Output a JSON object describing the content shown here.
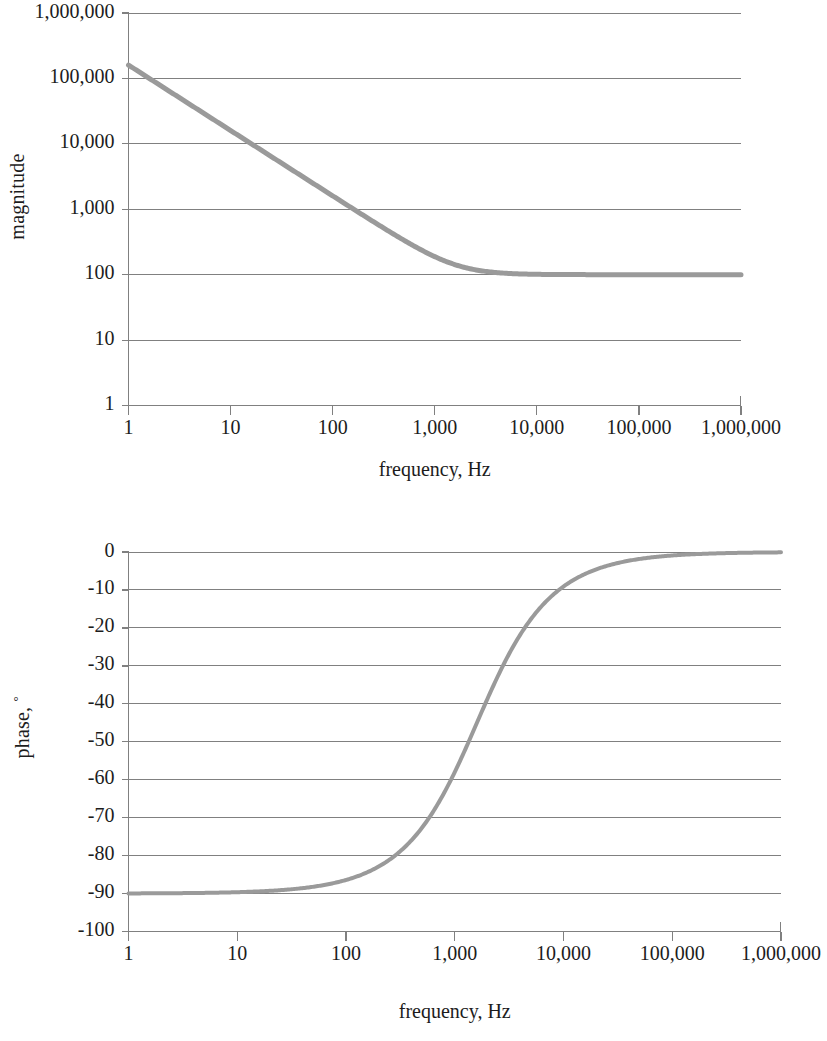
{
  "figure": {
    "panels": [
      "magnitude-plot",
      "phase-plot"
    ]
  },
  "magnitude": {
    "ylabel": "magnitude",
    "xlabel": "frequency, Hz",
    "y_ticks": [
      "1",
      "10",
      "100",
      "1,000",
      "10,000",
      "100,000",
      "1,000,000"
    ],
    "x_ticks": [
      "1",
      "10",
      "100",
      "1,000",
      "10,000",
      "100,000",
      "1,000,000"
    ]
  },
  "phase": {
    "ylabel_text": "phase, ",
    "ylabel_degree": "°",
    "xlabel": "frequency, Hz",
    "y_ticks": [
      "0",
      "-10",
      "-20",
      "-30",
      "-40",
      "-50",
      "-60",
      "-70",
      "-80",
      "-90",
      "-100"
    ],
    "x_ticks": [
      "1",
      "10",
      "100",
      "1,000",
      "10,000",
      "100,000",
      "1,000,000"
    ]
  },
  "colors": {
    "curve": "#9a9a9a",
    "grid": "#808080",
    "text": "#1c1c1c",
    "background": "#ffffff"
  },
  "chart_data": [
    {
      "type": "line",
      "id": "magnitude-plot",
      "title": "",
      "xlabel": "frequency, Hz",
      "ylabel": "magnitude",
      "xscale": "log",
      "yscale": "log",
      "xlim": [
        1,
        1000000
      ],
      "ylim": [
        1,
        1000000
      ],
      "xticks": [
        1,
        10,
        100,
        1000,
        10000,
        100000,
        1000000
      ],
      "xticklabels": [
        "1",
        "10",
        "100",
        "1,000",
        "10,000",
        "100,000",
        "1,000,000"
      ],
      "yticks": [
        1,
        10,
        100,
        1000,
        10000,
        100000,
        1000000
      ],
      "yticklabels": [
        "1",
        "10",
        "100",
        "1,000",
        "10,000",
        "100,000",
        "1,000,000"
      ],
      "grid": "horizontal",
      "legend": null,
      "description": "First-order low-pass magnitude asymptote: DC gain approx 1.6e5 at 1 Hz, -20 dB/decade roll-off, flattening to plateau of 100 above approx 5,000 Hz",
      "model": "|H(f)| = 100 * sqrt(1 + (f0/f)^2) with f0 = 1600 Hz",
      "series": [
        {
          "name": "magnitude",
          "x": [
            1,
            2,
            5,
            10,
            20,
            50,
            100,
            200,
            500,
            1000,
            1600,
            2000,
            3000,
            5000,
            10000,
            20000,
            50000,
            100000,
            300000,
            1000000
          ],
          "y": [
            160000,
            80000,
            32000,
            16000,
            8000,
            3200,
            1600,
            800,
            322,
            189,
            141,
            128,
            113,
            105,
            101,
            100.3,
            100.1,
            100,
            100,
            100
          ]
        }
      ]
    },
    {
      "type": "line",
      "id": "phase-plot",
      "title": "",
      "xlabel": "frequency, Hz",
      "ylabel": "phase, °",
      "xscale": "log",
      "yscale": "linear",
      "xlim": [
        1,
        1000000
      ],
      "ylim": [
        -100,
        0
      ],
      "xticks": [
        1,
        10,
        100,
        1000,
        10000,
        100000,
        1000000
      ],
      "xticklabels": [
        "1",
        "10",
        "100",
        "1,000",
        "10,000",
        "100,000",
        "1,000,000"
      ],
      "yticks": [
        0,
        -10,
        -20,
        -30,
        -40,
        -50,
        -60,
        -70,
        -80,
        -90,
        -100
      ],
      "yticklabels": [
        "0",
        "-10",
        "-20",
        "-30",
        "-40",
        "-50",
        "-60",
        "-70",
        "-80",
        "-90",
        "-100"
      ],
      "grid": "horizontal",
      "legend": null,
      "description": "Phase rises from -90 degrees at low frequency through -45 degrees near 1,600 Hz to 0 degrees at high frequency",
      "model": "phase(f) = -atan(f0/f) in degrees, f0 = 1600 Hz",
      "series": [
        {
          "name": "phase",
          "x": [
            1,
            3,
            10,
            30,
            100,
            200,
            300,
            500,
            700,
            1000,
            1600,
            2500,
            4000,
            6000,
            10000,
            20000,
            50000,
            100000,
            300000,
            1000000
          ],
          "y": [
            -89.96,
            -89.9,
            -89.6,
            -88.9,
            -86.4,
            -82.9,
            -79.4,
            -72.6,
            -66.4,
            -58.0,
            -45.0,
            -32.6,
            -21.8,
            -15.0,
            -9.1,
            -4.6,
            -1.8,
            -0.9,
            -0.3,
            -0.09
          ]
        }
      ]
    }
  ]
}
